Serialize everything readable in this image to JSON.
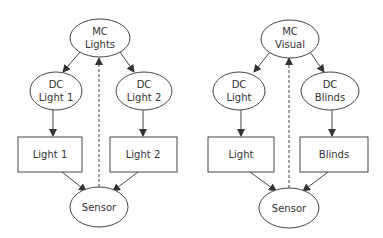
{
  "diagrams": [
    {
      "name": "lights",
      "mc": {
        "line1": "MC",
        "line2": "Lights"
      },
      "dc_left": {
        "line1": "DC",
        "line2": "Light 1"
      },
      "dc_right": {
        "line1": "DC",
        "line2": "Light 2"
      },
      "box_left": "Light 1",
      "box_right": "Light 2",
      "sensor": "Sensor"
    },
    {
      "name": "visual",
      "mc": {
        "line1": "MC",
        "line2": "Visual"
      },
      "dc_left": {
        "line1": "DC",
        "line2": "Light"
      },
      "dc_right": {
        "line1": "DC",
        "line2": "Blinds"
      },
      "box_left": "Light",
      "box_right": "Blinds",
      "sensor": "Sensor"
    }
  ],
  "colors": {
    "stroke": "#444444",
    "text": "#333333",
    "background": "#ffffff"
  }
}
